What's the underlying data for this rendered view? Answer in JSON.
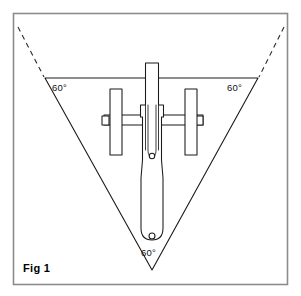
{
  "figure": {
    "caption": "Fig 1",
    "background_color": "#ffffff",
    "ink_color": "#1a1a1a",
    "frame_color": "#8c8c8c",
    "frame": {
      "x": 13,
      "y": 13,
      "width": 275,
      "height": 272
    },
    "angle_labels": [
      {
        "id": "left",
        "text": "60°",
        "x": 52,
        "y": 88
      },
      {
        "id": "right",
        "text": "60°",
        "x": 228,
        "y": 88
      },
      {
        "id": "apex",
        "text": "60°",
        "x": 142,
        "y": 253
      }
    ],
    "triangle": {
      "description": "inverted equilateral triangle with 60 degree angles at all vertices",
      "top_left": {
        "x": 45,
        "y": 78
      },
      "top_right": {
        "x": 258,
        "y": 78
      },
      "apex": {
        "x": 152,
        "y": 270
      }
    },
    "extension_lines": [
      {
        "id": "left-dashed-extension",
        "x1": 18,
        "y1": 27,
        "x2": 44,
        "y2": 77
      },
      {
        "id": "right-dashed-extension",
        "x1": 284,
        "y1": 27,
        "x2": 259,
        "y2": 77
      }
    ],
    "tool": {
      "name": "forked-blade-assembly",
      "shaft": {
        "x": 145,
        "y": 63,
        "width": 14,
        "height": 100
      },
      "lower_blade": {
        "top_y": 158,
        "tip_y": 238,
        "tip_width": 19
      },
      "fork_slot": {
        "x": 148,
        "y": 105,
        "width": 8,
        "depth": 52
      },
      "pivots": [
        {
          "id": "upper-pivot",
          "cx": 152,
          "cy": 156,
          "r": 2.6
        },
        {
          "id": "lower-pivot",
          "cx": 152,
          "cy": 236,
          "r": 2.9
        }
      ],
      "left_roller_plate": {
        "x": 110,
        "y": 89,
        "width": 12,
        "height": 66
      },
      "right_roller_plate": {
        "x": 185,
        "y": 89,
        "width": 12,
        "height": 66
      },
      "left_axle_bar": {
        "x": 104,
        "y": 115,
        "width": 45,
        "height": 10
      },
      "right_axle_bar": {
        "x": 158,
        "y": 115,
        "width": 45,
        "height": 10
      },
      "left_end_cap": {
        "x": 104,
        "y": 116,
        "width": 6,
        "height": 8
      },
      "right_end_cap": {
        "x": 196,
        "y": 116,
        "width": 6,
        "height": 8
      }
    }
  }
}
